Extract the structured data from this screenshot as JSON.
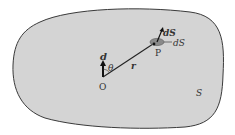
{
  "diagram": {
    "colors": {
      "fill": "#d4d4d4",
      "outline": "#3a3a3a",
      "element_fill": "#8a8a8a",
      "text": "#333333"
    },
    "labels": {
      "dipole": "d",
      "theta": "θ",
      "origin": "O",
      "position_vector": "r",
      "point": "P",
      "area_vector": "dS",
      "area_element": "dS",
      "surface": "S"
    }
  }
}
